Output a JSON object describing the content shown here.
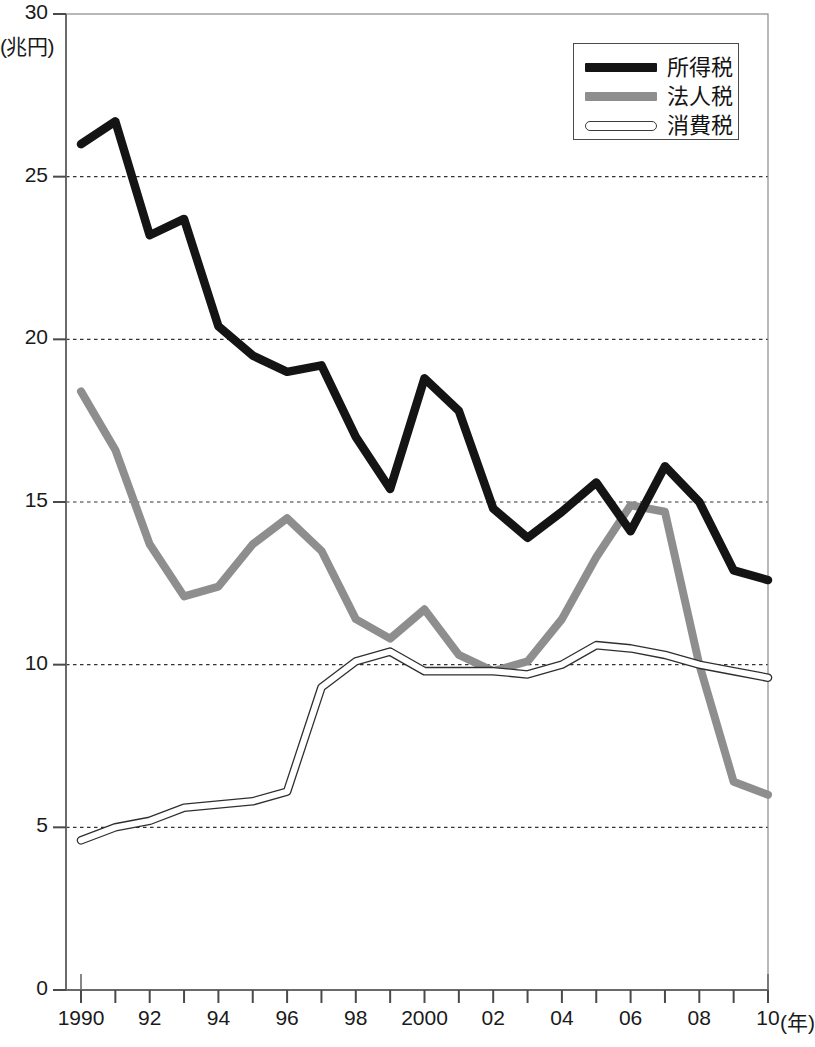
{
  "chart_data": {
    "type": "line",
    "title": "",
    "xlabel": "年",
    "ylabel": "兆円",
    "ylim": [
      0,
      30
    ],
    "xlim": [
      1990,
      2010
    ],
    "yticks": [
      0,
      5,
      10,
      15,
      20,
      25,
      30
    ],
    "grid": "horizontal-dotted",
    "legend_position": "top-right",
    "x": [
      1990,
      1991,
      1992,
      1993,
      1994,
      1995,
      1996,
      1997,
      1998,
      1999,
      2000,
      2001,
      2002,
      2003,
      2004,
      2005,
      2006,
      2007,
      2008,
      2009,
      2010
    ],
    "xtick_labels": [
      "1990",
      "",
      "92",
      "",
      "94",
      "",
      "96",
      "",
      "98",
      "",
      "2000",
      "",
      "02",
      "",
      "04",
      "",
      "06",
      "",
      "08",
      "",
      "10"
    ],
    "series": [
      {
        "name": "所得税",
        "color": "#141414",
        "style": "thick-solid-black",
        "values": [
          26.0,
          26.7,
          23.2,
          23.7,
          20.4,
          19.5,
          19.0,
          19.2,
          17.0,
          15.4,
          18.8,
          17.8,
          14.8,
          13.9,
          14.7,
          15.6,
          14.1,
          16.1,
          15.0,
          12.9,
          12.6
        ]
      },
      {
        "name": "法人税",
        "color": "#8e8e8e",
        "style": "thick-solid-gray",
        "values": [
          18.4,
          16.6,
          13.7,
          12.1,
          12.4,
          13.7,
          14.5,
          13.5,
          11.4,
          10.8,
          11.7,
          10.3,
          9.8,
          10.1,
          11.4,
          13.3,
          14.9,
          14.7,
          10.0,
          6.4,
          6.0
        ]
      },
      {
        "name": "消費税",
        "color": "#ffffff",
        "style": "thin-outlined-white",
        "values": [
          4.6,
          5.0,
          5.2,
          5.6,
          5.7,
          5.8,
          6.1,
          9.3,
          10.1,
          10.4,
          9.8,
          9.8,
          9.8,
          9.7,
          10.0,
          10.6,
          10.5,
          10.3,
          10.0,
          9.8,
          9.6
        ]
      }
    ]
  },
  "axis": {
    "y_unit": "(兆円)",
    "x_unit": "(年)"
  },
  "legend": {
    "items": [
      {
        "label": "所得税"
      },
      {
        "label": "法人税"
      },
      {
        "label": "消費税"
      }
    ]
  }
}
